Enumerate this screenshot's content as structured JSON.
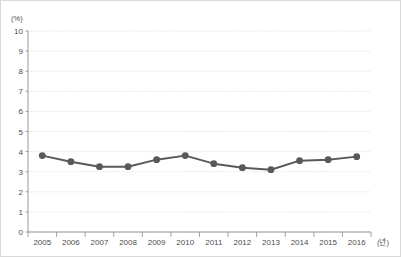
{
  "chart_data": {
    "type": "line",
    "title": "",
    "subtitle": "",
    "xlabel": "(년)",
    "ylabel": "(%)",
    "categories": [
      "2005",
      "2006",
      "2007",
      "2008",
      "2009",
      "2010",
      "2011",
      "2012",
      "2013",
      "2014",
      "2015",
      "2016"
    ],
    "values": [
      3.8,
      3.5,
      3.25,
      3.25,
      3.6,
      3.8,
      3.4,
      3.2,
      3.1,
      3.55,
      3.6,
      3.75
    ],
    "series": [
      {
        "name": "",
        "values": [
          3.8,
          3.5,
          3.25,
          3.25,
          3.6,
          3.8,
          3.4,
          3.2,
          3.1,
          3.55,
          3.6,
          3.75
        ]
      }
    ],
    "ylim": [
      0,
      10
    ],
    "yticks": [
      "0",
      "1",
      "2",
      "3",
      "4",
      "5",
      "6",
      "7",
      "8",
      "9",
      "10"
    ],
    "ytick_values": [
      0,
      1,
      2,
      3,
      4,
      5,
      6,
      7,
      8,
      9,
      10
    ],
    "grid": true,
    "grid_style": "dotted-horizontal",
    "legend": "none",
    "legend_position": "none",
    "annotations": [],
    "colors": {
      "series_line": "#595959",
      "series_marker": "#595959",
      "gridline": "#c8c8c8",
      "axis": "#8c8c8c",
      "tick_label": "#4d4d4d",
      "background": "#ffffff",
      "frame_border": "#d9d9d9"
    },
    "axis_units": {
      "y_unit_label": "(%)",
      "x_unit_label": "(년)"
    }
  }
}
